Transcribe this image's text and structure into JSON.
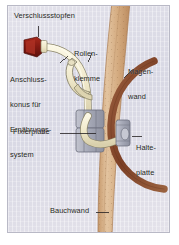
{
  "figure": {
    "kind": "medical-illustration",
    "language": "de",
    "panel": {
      "background_color": "#dcdce6",
      "border_color": "#b9b9c6"
    }
  },
  "labels": {
    "verschlussstopfen": "Verschlussstopfen",
    "rollenklemme_line1": "Rollen-",
    "rollenklemme_line2": "klemme",
    "anschlusskonus_line1": "Anschluss-",
    "anschlusskonus_line2": "konus für",
    "anschlusskonus_line3": "Ernährungs-",
    "anschlusskonus_line4": "system",
    "magenwand_line1": "Magen-",
    "magenwand_line2": "wand",
    "fixierplatte": "Fixierplatte",
    "halteplatte_line1": "Halte-",
    "halteplatte_line2": "platte",
    "bauchwand": "Bauchwand"
  },
  "parts": {
    "verschlussstopfen": {
      "name": "cap-plug",
      "color": "#8e1f16"
    },
    "tube": {
      "name": "feeding-tube",
      "color": "#f2ecd2",
      "outline": "#8a8468"
    },
    "rollenklemme": {
      "name": "roller-clamp",
      "color": "#efe9cf"
    },
    "fixierplatte": {
      "name": "external-fixation-plate",
      "color": "#aeb0bd"
    },
    "halteplatte": {
      "name": "internal-retention-plate",
      "color": "#aeb0bd"
    },
    "bauchwand": {
      "name": "abdominal-wall",
      "color": "#d8b38a"
    },
    "magenwand": {
      "name": "stomach-wall",
      "color": "#8d5236"
    }
  },
  "leaders": {
    "count": 6,
    "color": "#231f20"
  }
}
